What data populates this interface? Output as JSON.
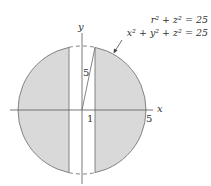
{
  "diagram": {
    "equations": {
      "cylindrical": "r² + z² = 25",
      "rectangular": "x² + y² + z² = 25"
    },
    "axes": {
      "x_label": "x",
      "y_label": "y"
    },
    "labels": {
      "radius_label": "5",
      "inner_x_tick": "1",
      "outer_x_tick": "5"
    },
    "colors": {
      "fill": "#d9d9d9",
      "stroke": "#777777",
      "axis": "#555555",
      "background": "#ffffff"
    }
  }
}
